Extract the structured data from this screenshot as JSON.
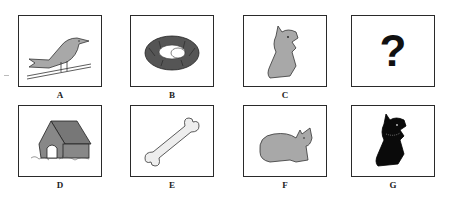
{
  "puzzle": {
    "top_row": [
      {
        "label": "A",
        "image": "bird-on-branch"
      },
      {
        "label": "B",
        "image": "nest-with-eggs"
      },
      {
        "label": "C",
        "image": "gray-dog-sitting"
      },
      {
        "label": "",
        "image": "question-mark",
        "symbol": "?"
      }
    ],
    "bottom_row": [
      {
        "label": "D",
        "image": "doghouse"
      },
      {
        "label": "E",
        "image": "bone"
      },
      {
        "label": "F",
        "image": "gray-cat-sitting"
      },
      {
        "label": "G",
        "image": "black-dog-sitting"
      }
    ]
  },
  "colors": {
    "border": "#2a2a2a",
    "gray_fill": "#a8a8a8",
    "dark_fill": "#555555",
    "black_fill": "#0a0a0a",
    "bone_fill": "#eeeeee"
  }
}
